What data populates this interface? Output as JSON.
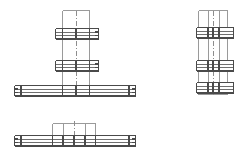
{
  "drawing": {
    "title": "Structural grating assembly orthographic views",
    "type": "technical-line-drawing",
    "background_color": "#ffffff",
    "line_color": "#6f6f6f",
    "line_color_dark": "#4a4a4a",
    "line_color_light": "#9a9a9a",
    "centerline_color": "#8d8d8d",
    "canvas": {
      "width": 244,
      "height": 166
    },
    "views": [
      {
        "id": "view-front",
        "name": "front-elevation",
        "label": "",
        "origin": {
          "x": 14,
          "y": 8
        },
        "description": "T-shaped assembly: vertical column with two short cross beams and one long base beam",
        "column": {
          "x": 62,
          "y": 10,
          "width": 28,
          "height": 80,
          "bays": 2
        },
        "beams": [
          {
            "name": "upper-cross-beam",
            "x": 55,
            "y": 28,
            "width": 44,
            "height": 11,
            "rows": 3,
            "end_bracket_right": true
          },
          {
            "name": "middle-cross-beam",
            "x": 55,
            "y": 60,
            "width": 44,
            "height": 11,
            "rows": 3,
            "end_bracket_right": true
          },
          {
            "name": "base-beam",
            "x": 14,
            "y": 85,
            "width": 122,
            "height": 11,
            "rows": 3,
            "end_bracket_left": true,
            "end_bracket_right": true
          }
        ]
      },
      {
        "id": "view-side",
        "name": "side-elevation",
        "label": "",
        "origin": {
          "x": 196,
          "y": 8
        },
        "description": "Tall column with three stacked horizontal beam groups",
        "column": {
          "x": 198,
          "y": 10,
          "width": 30,
          "height": 85,
          "bays": 2
        },
        "beams": [
          {
            "name": "upper-beam",
            "x": 196,
            "y": 27,
            "width": 38,
            "height": 11,
            "rows": 3
          },
          {
            "name": "middle-beam",
            "x": 196,
            "y": 60,
            "width": 38,
            "height": 11,
            "rows": 3
          },
          {
            "name": "lower-beam",
            "x": 196,
            "y": 82,
            "width": 38,
            "height": 11,
            "rows": 3
          }
        ]
      },
      {
        "id": "view-plan",
        "name": "plan-view",
        "label": "",
        "origin": {
          "x": 14,
          "y": 120
        },
        "description": "Long horizontal beam with central box section above",
        "column": {
          "x": 52,
          "y": 123,
          "width": 44,
          "height": 18,
          "bays": 3
        },
        "beams": [
          {
            "name": "plan-beam",
            "x": 14,
            "y": 135,
            "width": 122,
            "height": 11,
            "rows": 3,
            "end_bracket_left": true,
            "end_bracket_right": true
          }
        ]
      }
    ],
    "legend": []
  }
}
